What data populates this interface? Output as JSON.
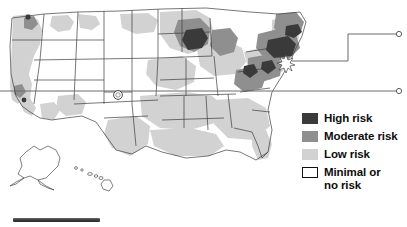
{
  "map": {
    "title": "United States risk map",
    "region_label": "Continental United States with Alaska and Hawaii insets",
    "colors": {
      "high_risk": "#3a3a3a",
      "moderate_risk": "#8f8f8f",
      "low_risk": "#d2d2d2",
      "minimal_risk": "#ffffff",
      "border": "#3c3c3c",
      "leader_line": "#5a5a5a"
    }
  },
  "legend": {
    "items": [
      {
        "label": "High risk",
        "swatch": "high-risk-swatch"
      },
      {
        "label": "Moderate risk",
        "swatch": "moderate-risk-swatch"
      },
      {
        "label": "Low risk",
        "swatch": "low-risk-swatch"
      },
      {
        "label": "Minimal or\nno risk",
        "swatch": "minimal-risk-swatch"
      }
    ]
  },
  "callouts": [
    {
      "name": "upper-callout",
      "marker": "open-circle"
    },
    {
      "name": "lower-callout",
      "marker": "open-circle"
    }
  ],
  "markers": [
    {
      "name": "northeast-starburst-marker",
      "shape": "starburst"
    },
    {
      "name": "mountain-west-circle-marker",
      "shape": "circle"
    }
  ],
  "insets": [
    {
      "name": "alaska-inset",
      "label": "Alaska"
    },
    {
      "name": "hawaii-inset",
      "label": "Hawaii"
    }
  ]
}
